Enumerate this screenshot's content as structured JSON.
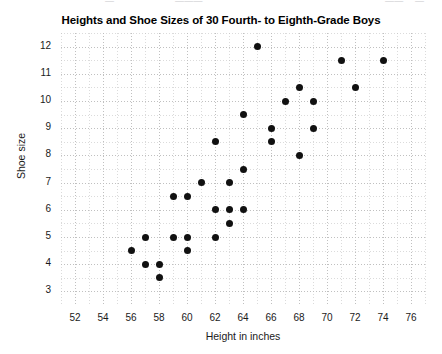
{
  "ghost_text": "partially cropped text row above figure",
  "chart_data": {
    "type": "scatter",
    "title": "Heights and Shoe Sizes of 30 Fourth- to Eighth-Grade Boys",
    "xlabel": "Height in inches",
    "ylabel": "Shoe size",
    "xlim": [
      51,
      77
    ],
    "ylim": [
      2.5,
      12.5
    ],
    "x_ticks": [
      52,
      54,
      56,
      58,
      60,
      62,
      64,
      66,
      68,
      70,
      72,
      74,
      76
    ],
    "y_ticks": [
      3,
      4,
      5,
      6,
      7,
      8,
      9,
      10,
      11,
      12
    ],
    "x_minor_step": 1,
    "y_minor_step": 0.5,
    "grid": true,
    "legend": "none",
    "n_points": 30,
    "point_color": "#111111",
    "points": [
      {
        "x": 56,
        "y": 4.5
      },
      {
        "x": 57,
        "y": 5
      },
      {
        "x": 57,
        "y": 4
      },
      {
        "x": 58,
        "y": 4
      },
      {
        "x": 58,
        "y": 3.5
      },
      {
        "x": 59,
        "y": 6.5
      },
      {
        "x": 59,
        "y": 5
      },
      {
        "x": 60,
        "y": 6.5
      },
      {
        "x": 60,
        "y": 5
      },
      {
        "x": 60,
        "y": 4.5
      },
      {
        "x": 61,
        "y": 7
      },
      {
        "x": 62,
        "y": 8.5
      },
      {
        "x": 62,
        "y": 6
      },
      {
        "x": 62,
        "y": 5
      },
      {
        "x": 63,
        "y": 7
      },
      {
        "x": 63,
        "y": 6
      },
      {
        "x": 63,
        "y": 5.5
      },
      {
        "x": 64,
        "y": 9.5
      },
      {
        "x": 64,
        "y": 7.5
      },
      {
        "x": 64,
        "y": 6
      },
      {
        "x": 65,
        "y": 12
      },
      {
        "x": 66,
        "y": 9
      },
      {
        "x": 66,
        "y": 8.5
      },
      {
        "x": 67,
        "y": 10
      },
      {
        "x": 68,
        "y": 10.5
      },
      {
        "x": 68,
        "y": 8
      },
      {
        "x": 69,
        "y": 10
      },
      {
        "x": 69,
        "y": 9
      },
      {
        "x": 71,
        "y": 11.5
      },
      {
        "x": 72,
        "y": 10.5
      },
      {
        "x": 74,
        "y": 11.5
      }
    ]
  }
}
